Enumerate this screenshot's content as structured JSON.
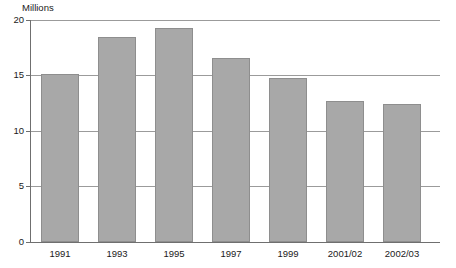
{
  "chart_data": {
    "type": "bar",
    "title": "",
    "subtitle": "",
    "xlabel": "",
    "ylabel": "Millions",
    "unit_label": "Millions",
    "categories": [
      "1991",
      "1993",
      "1995",
      "1997",
      "1999",
      "2001/02",
      "2002/03"
    ],
    "values": [
      15.1,
      18.5,
      19.3,
      16.6,
      14.8,
      12.7,
      12.4
    ],
    "series": [
      {
        "name": "",
        "values": [
          15.1,
          18.5,
          19.3,
          16.6,
          14.8,
          12.7,
          12.4
        ]
      }
    ],
    "ylim": [
      0,
      20
    ],
    "yticks": [
      0,
      5,
      10,
      15,
      20
    ],
    "ytick_labels": [
      "0",
      "5",
      "10",
      "15",
      "20"
    ],
    "grid": true,
    "grid_axis": "y",
    "legend": false,
    "legend_position": "none",
    "bar_color": "#a8a8a8",
    "bar_border_color": "#8e8e8e",
    "gridline_color": "#9b9b9b",
    "axis_color": "#6f6f6f",
    "background_color": "#ffffff",
    "text_color": "#1a1a1a"
  }
}
